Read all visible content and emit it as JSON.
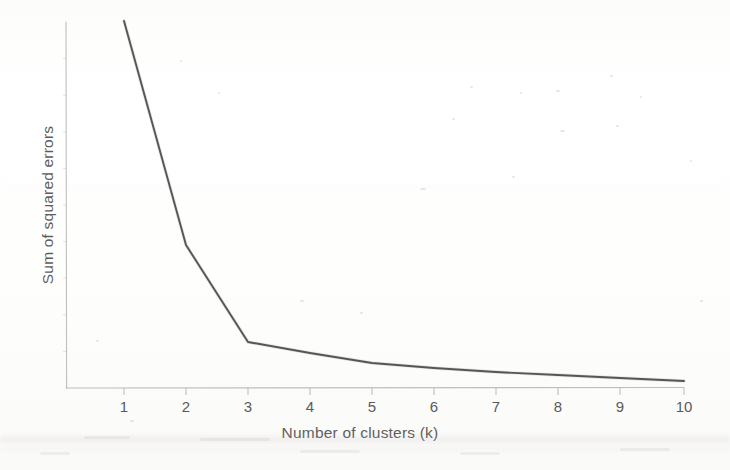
{
  "figure": {
    "kind": "scanned-line-chart",
    "background_color": "#fefefe",
    "line_color": "#4a4a4a",
    "axis_color": "#b4b4b4",
    "text_color": "#5a5a5a"
  },
  "chart_data": {
    "type": "line",
    "title": "",
    "subtitle": "",
    "xlabel": "Number of clusters (k)",
    "ylabel": "Sum of squared errors",
    "x": [
      1,
      2,
      3,
      4,
      5,
      6,
      7,
      8,
      9,
      10
    ],
    "xtick_labels": [
      "1",
      "2",
      "3",
      "4",
      "5",
      "6",
      "7",
      "8",
      "9",
      "10"
    ],
    "ytick_labels": [],
    "values": [
      1.0,
      0.39,
      0.125,
      0.095,
      0.068,
      0.055,
      0.044,
      0.036,
      0.027,
      0.019
    ],
    "series": [
      {
        "name": "Sum of squared errors",
        "values": [
          1.0,
          0.39,
          0.125,
          0.095,
          0.068,
          0.055,
          0.044,
          0.036,
          0.027,
          0.019
        ]
      }
    ],
    "xlim": [
      1,
      10
    ],
    "ylim": [
      0,
      1.0
    ],
    "grid": false,
    "legend": false,
    "legend_position": "none",
    "markers": false,
    "annotations": [],
    "elbow_k": 3
  },
  "axes": {
    "x_title": "Number of clusters (k)",
    "y_title": "Sum of squared errors"
  },
  "geometry": {
    "plot_left": 66,
    "plot_right": 684,
    "plot_top": 22,
    "plot_bottom": 388,
    "tick_x": [
      124,
      186,
      248,
      310,
      372,
      434,
      496,
      558,
      620,
      684
    ],
    "point_y": [
      21,
      245,
      342,
      353,
      363,
      368,
      372,
      375,
      378,
      381
    ],
    "tick_length": 7
  }
}
